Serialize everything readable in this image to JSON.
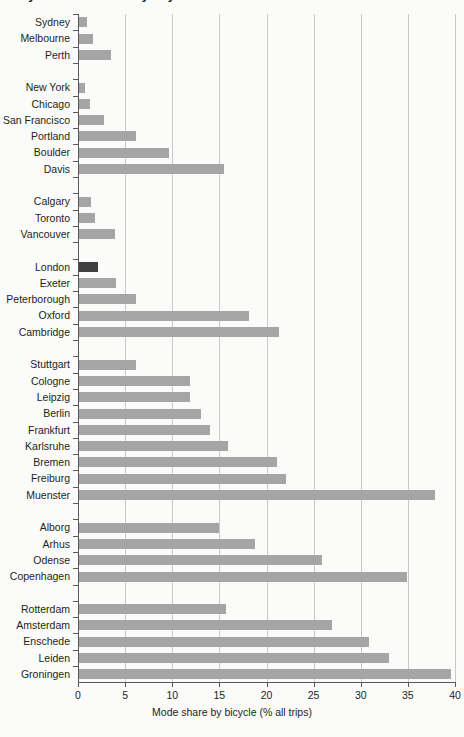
{
  "figure": {
    "clipped_title_fragment": "Bicycle mode share by city",
    "axis_title": "Mode share by bicycle (% all trips)"
  },
  "colors": {
    "bar": "#a5a5a5",
    "bar_highlight": "#3f3f3f",
    "gridline": "#c9c9c9",
    "axis": "#58585a",
    "background": "#fbfbfa",
    "text": "#231f20"
  },
  "chart_data": {
    "type": "bar",
    "orientation": "horizontal",
    "title": "",
    "xlabel": "Mode share by bicycle (% all trips)",
    "ylabel": "",
    "xlim": [
      0,
      40
    ],
    "xticks": [
      "0",
      "5",
      "10",
      "15",
      "20",
      "25",
      "30",
      "35",
      "40"
    ],
    "grid": "vertical",
    "legend": null,
    "highlighted_category": "London",
    "categories": [
      "Sydney",
      "Melbourne",
      "Perth",
      "New York",
      "Chicago",
      "San Francisco",
      "Portland",
      "Boulder",
      "Davis",
      "Calgary",
      "Toronto",
      "Vancouver",
      "London",
      "Exeter",
      "Peterborough",
      "Oxford",
      "Cambridge",
      "Stuttgart",
      "Cologne",
      "Leipzig",
      "Berlin",
      "Frankfurt",
      "Karlsruhe",
      "Bremen",
      "Freiburg",
      "Muenster",
      "Alborg",
      "Arhus",
      "Odense",
      "Copenhagen",
      "Rotterdam",
      "Amsterdam",
      "Enschede",
      "Leiden",
      "Groningen"
    ],
    "values": [
      0.8,
      1.5,
      3.4,
      0.6,
      1.2,
      2.6,
      6.0,
      9.5,
      15.4,
      1.3,
      1.7,
      3.8,
      2.0,
      3.9,
      6.0,
      18.0,
      21.2,
      6.0,
      11.8,
      11.8,
      12.9,
      13.9,
      15.8,
      21.0,
      22.0,
      37.8,
      14.9,
      18.7,
      25.8,
      34.8,
      15.6,
      26.8,
      30.8,
      32.9,
      39.5
    ],
    "rows": [
      {
        "label": "Sydney",
        "value": 0.8,
        "highlight": false,
        "spacer": false
      },
      {
        "label": "Melbourne",
        "value": 1.5,
        "highlight": false,
        "spacer": false
      },
      {
        "label": "Perth",
        "value": 3.4,
        "highlight": false,
        "spacer": false
      },
      {
        "label": "",
        "value": null,
        "highlight": false,
        "spacer": true
      },
      {
        "label": "New York",
        "value": 0.6,
        "highlight": false,
        "spacer": false
      },
      {
        "label": "Chicago",
        "value": 1.2,
        "highlight": false,
        "spacer": false
      },
      {
        "label": "San Francisco",
        "value": 2.6,
        "highlight": false,
        "spacer": false
      },
      {
        "label": "Portland",
        "value": 6.0,
        "highlight": false,
        "spacer": false
      },
      {
        "label": "Boulder",
        "value": 9.5,
        "highlight": false,
        "spacer": false
      },
      {
        "label": "Davis",
        "value": 15.4,
        "highlight": false,
        "spacer": false
      },
      {
        "label": "",
        "value": null,
        "highlight": false,
        "spacer": true
      },
      {
        "label": "Calgary",
        "value": 1.3,
        "highlight": false,
        "spacer": false
      },
      {
        "label": "Toronto",
        "value": 1.7,
        "highlight": false,
        "spacer": false
      },
      {
        "label": "Vancouver",
        "value": 3.8,
        "highlight": false,
        "spacer": false
      },
      {
        "label": "",
        "value": null,
        "highlight": false,
        "spacer": true
      },
      {
        "label": "London",
        "value": 2.0,
        "highlight": true,
        "spacer": false
      },
      {
        "label": "Exeter",
        "value": 3.9,
        "highlight": false,
        "spacer": false
      },
      {
        "label": "Peterborough",
        "value": 6.0,
        "highlight": false,
        "spacer": false
      },
      {
        "label": "Oxford",
        "value": 18.0,
        "highlight": false,
        "spacer": false
      },
      {
        "label": "Cambridge",
        "value": 21.2,
        "highlight": false,
        "spacer": false
      },
      {
        "label": "",
        "value": null,
        "highlight": false,
        "spacer": true
      },
      {
        "label": "Stuttgart",
        "value": 6.0,
        "highlight": false,
        "spacer": false
      },
      {
        "label": "Cologne",
        "value": 11.8,
        "highlight": false,
        "spacer": false
      },
      {
        "label": "Leipzig",
        "value": 11.8,
        "highlight": false,
        "spacer": false
      },
      {
        "label": "Berlin",
        "value": 12.9,
        "highlight": false,
        "spacer": false
      },
      {
        "label": "Frankfurt",
        "value": 13.9,
        "highlight": false,
        "spacer": false
      },
      {
        "label": "Karlsruhe",
        "value": 15.8,
        "highlight": false,
        "spacer": false
      },
      {
        "label": "Bremen",
        "value": 21.0,
        "highlight": false,
        "spacer": false
      },
      {
        "label": "Freiburg",
        "value": 22.0,
        "highlight": false,
        "spacer": false
      },
      {
        "label": "Muenster",
        "value": 37.8,
        "highlight": false,
        "spacer": false
      },
      {
        "label": "",
        "value": null,
        "highlight": false,
        "spacer": true
      },
      {
        "label": "Alborg",
        "value": 14.9,
        "highlight": false,
        "spacer": false
      },
      {
        "label": "Arhus",
        "value": 18.7,
        "highlight": false,
        "spacer": false
      },
      {
        "label": "Odense",
        "value": 25.8,
        "highlight": false,
        "spacer": false
      },
      {
        "label": "Copenhagen",
        "value": 34.8,
        "highlight": false,
        "spacer": false
      },
      {
        "label": "",
        "value": null,
        "highlight": false,
        "spacer": true
      },
      {
        "label": "Rotterdam",
        "value": 15.6,
        "highlight": false,
        "spacer": false
      },
      {
        "label": "Amsterdam",
        "value": 26.8,
        "highlight": false,
        "spacer": false
      },
      {
        "label": "Enschede",
        "value": 30.8,
        "highlight": false,
        "spacer": false
      },
      {
        "label": "Leiden",
        "value": 32.9,
        "highlight": false,
        "spacer": false
      },
      {
        "label": "Groningen",
        "value": 39.5,
        "highlight": false,
        "spacer": false
      }
    ]
  }
}
